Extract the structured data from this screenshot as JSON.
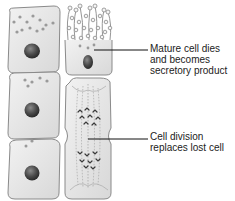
{
  "diagram": {
    "annotations": [
      {
        "id": "mature-cell-dies",
        "lines": [
          "Mature cell dies",
          "and becomes",
          "secretory product"
        ]
      },
      {
        "id": "cell-division",
        "lines": [
          "Cell division",
          "replaces lost cell"
        ]
      }
    ],
    "colors": {
      "cell_fill": "#e8e8e8",
      "cell_outline": "#8a8a8a",
      "nucleus": "#3a3a3a",
      "granule": "#9a9a9a",
      "leader_line": "#111111",
      "text": "#222222"
    }
  }
}
